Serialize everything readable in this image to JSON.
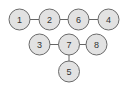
{
  "diagram": {
    "type": "graph",
    "width": 124,
    "height": 88,
    "node_radius": 10.5,
    "colors": {
      "background": "#ffffff",
      "node_fill": "#e2e2e2",
      "node_stroke": "#6a6a6a",
      "edge": "#666666",
      "label": "#333333"
    },
    "nodes": [
      {
        "id": "1",
        "label": "1",
        "x": 19.5,
        "y": 19.5
      },
      {
        "id": "2",
        "label": "2",
        "x": 49.5,
        "y": 19.5
      },
      {
        "id": "6",
        "label": "6",
        "x": 78.5,
        "y": 19.5
      },
      {
        "id": "4",
        "label": "4",
        "x": 108.5,
        "y": 19.5
      },
      {
        "id": "3",
        "label": "3",
        "x": 39.5,
        "y": 44.5
      },
      {
        "id": "7",
        "label": "7",
        "x": 69,
        "y": 44.5
      },
      {
        "id": "8",
        "label": "8",
        "x": 96.5,
        "y": 44.5
      },
      {
        "id": "5",
        "label": "5",
        "x": 69,
        "y": 71.5
      }
    ],
    "edges": [
      {
        "from": "1",
        "to": "2"
      },
      {
        "from": "2",
        "to": "6"
      },
      {
        "from": "6",
        "to": "4"
      },
      {
        "from": "3",
        "to": "7"
      },
      {
        "from": "7",
        "to": "8"
      },
      {
        "from": "7",
        "to": "5"
      }
    ]
  }
}
